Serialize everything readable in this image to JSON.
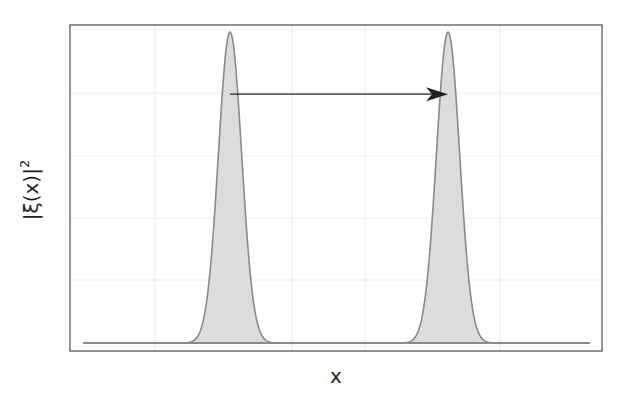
{
  "chart_data": {
    "type": "area",
    "title": "",
    "xlabel": "x",
    "ylabel": "|ξ(x)|²",
    "ylabel_base": "|ξ(x)|",
    "ylabel_exponent": "2",
    "grid": true,
    "legend": null,
    "xlim": [
      0,
      1
    ],
    "ylim": [
      0,
      1
    ],
    "series": [
      {
        "name": "wavepacket initial",
        "shape": "gaussian",
        "center": 0.29,
        "amplitude": 1.0,
        "width_sigma": 0.023,
        "fill": "#dcdcdc",
        "stroke": "#8a8a8a"
      },
      {
        "name": "wavepacket translated",
        "shape": "gaussian",
        "center": 0.72,
        "amplitude": 1.0,
        "width_sigma": 0.023,
        "fill": "#dcdcdc",
        "stroke": "#8a8a8a"
      }
    ],
    "annotations": [
      {
        "type": "arrow",
        "from_x": 0.29,
        "to_x": 0.72,
        "y": 0.8,
        "color": "#222222",
        "meaning": "translation of wavepacket"
      }
    ],
    "ticks": {
      "x": [],
      "y": []
    }
  },
  "colors": {
    "frame": "#666666",
    "grid": "#ececec",
    "fill": "#dcdcdc",
    "stroke": "#8a8a8a",
    "baseline": "#8a8a8a",
    "arrow": "#222222"
  }
}
